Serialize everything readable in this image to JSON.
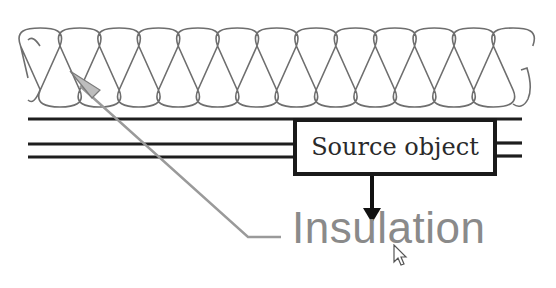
{
  "diagram": {
    "source_box": {
      "label": "Source object"
    },
    "annotation": {
      "label": "Insulation"
    },
    "colors": {
      "insulation_pattern": "#6e6e6e",
      "lines": "#1e1e1e",
      "leader": "#9a9a9a",
      "annotation_text": "#8a8a8a"
    },
    "elements": [
      "insulation-hatch-pattern",
      "wall-line-top",
      "wall-line-middle",
      "wall-line-bottom",
      "source-object-box",
      "down-arrow",
      "leader-line-with-arrowhead",
      "insulation-text",
      "mouse-cursor"
    ]
  }
}
